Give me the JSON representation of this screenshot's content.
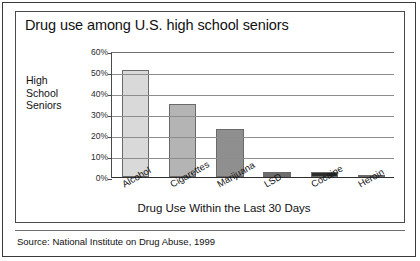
{
  "figure": {
    "title": "Drug use among U.S. high school seniors",
    "source_note": "Source: National Institute on Drug Abuse, 1999"
  },
  "chart_data": {
    "type": "bar",
    "title": "Drug use among U.S. high school seniors",
    "xlabel": "Drug Use Within the Last 30 Days",
    "ylabel": "High School Seniors",
    "ylabel_lines": [
      "High",
      "School",
      "Seniors"
    ],
    "categories": [
      "Alcohol",
      "Cigarettes",
      "Marijuana",
      "LSD",
      "Cocaine",
      "Heroin"
    ],
    "values": [
      51,
      35,
      23,
      2.5,
      2.5,
      0.8
    ],
    "ylim": [
      0,
      60
    ],
    "yticks": [
      0,
      10,
      20,
      30,
      40,
      50,
      60
    ],
    "ytick_labels": [
      "0%",
      "10%",
      "20%",
      "30%",
      "40%",
      "50%",
      "60%"
    ],
    "grid": true,
    "legend": "none",
    "bar_colors": [
      "#d9d9d9",
      "#b4b4b4",
      "#8f8f8f",
      "#6d6d6d",
      "#2c2c2c",
      "#3a3a3a"
    ]
  }
}
